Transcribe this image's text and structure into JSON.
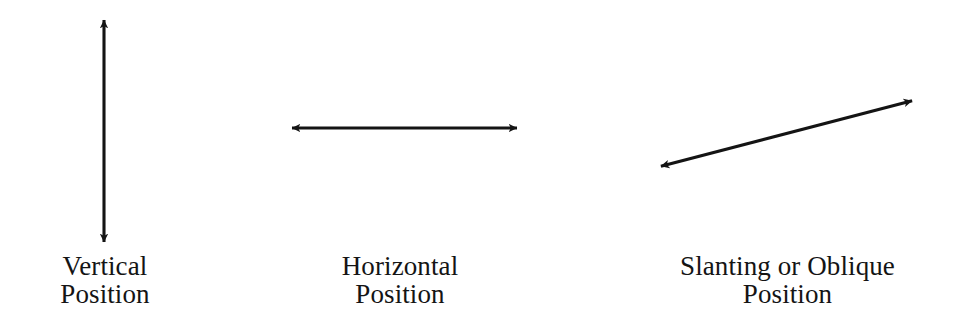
{
  "figure": {
    "background_color": "#ffffff",
    "ink_color": "#141414",
    "width": 970,
    "height": 331
  },
  "items": [
    {
      "id": "vertical",
      "arrow_name": "vertical-double-arrow",
      "orientation": "vertical",
      "double_headed": true,
      "label_line1": "Vertical",
      "label_line2": "Position",
      "geometry": {
        "x1": 104,
        "y1": 17,
        "x2": 104,
        "y2": 245
      }
    },
    {
      "id": "horizontal",
      "arrow_name": "horizontal-double-arrow",
      "orientation": "horizontal",
      "double_headed": true,
      "label_line1": "Horizontal",
      "label_line2": "Position",
      "geometry": {
        "x1": 289,
        "y1": 128,
        "x2": 520,
        "y2": 128
      }
    },
    {
      "id": "slanting",
      "arrow_name": "slanting-double-arrow",
      "orientation": "oblique",
      "double_headed": true,
      "label_line1": "Slanting or Oblique",
      "label_line2": "Position",
      "geometry": {
        "x1": 658,
        "y1": 167,
        "x2": 915,
        "y2": 100
      }
    }
  ]
}
